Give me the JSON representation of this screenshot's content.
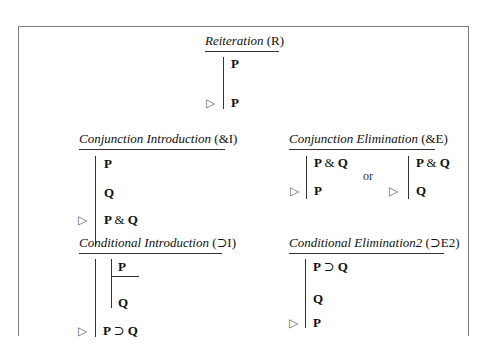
{
  "rules": {
    "reiteration": {
      "title": "Reiteration",
      "abbr": "(R)",
      "lines": [
        "P",
        "P"
      ],
      "conclusion_marker": "▷"
    },
    "conjunction_introduction": {
      "title": "Conjunction Introduction",
      "abbr": "(&I)",
      "lines": [
        "P",
        "Q"
      ],
      "conclusion": {
        "left": "P",
        "op": "&",
        "right": "Q"
      },
      "conclusion_marker": "▷"
    },
    "conjunction_elimination": {
      "title": "Conjunction Elimination",
      "abbr": "(&E)",
      "form1": {
        "premise": {
          "left": "P",
          "op": "&",
          "right": "Q"
        },
        "conclusion": "P"
      },
      "separator": "or",
      "form2": {
        "premise": {
          "left": "P",
          "op": "&",
          "right": "Q"
        },
        "conclusion": "Q"
      },
      "conclusion_marker": "▷"
    },
    "conditional_introduction": {
      "title": "Conditional Introduction",
      "abbr": "(⊃I)",
      "assumption": "P",
      "subconclusion": "Q",
      "conclusion": {
        "left": "P",
        "op": "⊃",
        "right": "Q"
      },
      "conclusion_marker": "▷"
    },
    "conditional_elimination2": {
      "title": "Conditional Elimination2",
      "abbr": "(⊃E2)",
      "premise1": {
        "left": "P",
        "op": "⊃",
        "right": "Q"
      },
      "premise2": "Q",
      "conclusion": "P",
      "conclusion_marker": "▷"
    }
  }
}
